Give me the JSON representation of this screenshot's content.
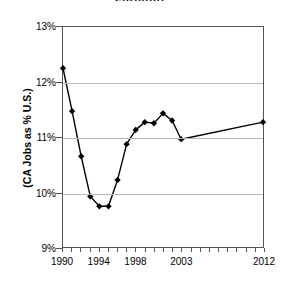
{
  "chart_data": {
    "type": "line",
    "title": "Furniture",
    "xlabel": "",
    "ylabel": "(CA Jobs as % U.S.)",
    "ylim": [
      9,
      13
    ],
    "ytick_labels": [
      "9%",
      "10%",
      "11%",
      "12%",
      "13%"
    ],
    "ytick_values": [
      9,
      10,
      11,
      12,
      13
    ],
    "xtick_labels": [
      "1990",
      "1994",
      "1998",
      "2003",
      "2012"
    ],
    "xtick_values": [
      1990,
      1994,
      1998,
      2003,
      2012
    ],
    "xlim": [
      1990,
      2012
    ],
    "grid": "horizontal",
    "legend": "none",
    "marker": "diamond",
    "line_color": "#000000",
    "grid_color": "#b9b9b9",
    "axis_color": "#555555",
    "categories": [
      1990,
      1991,
      1992,
      1993,
      1994,
      1995,
      1996,
      1997,
      1998,
      1999,
      2000,
      2001,
      2002,
      2003,
      2012
    ],
    "values": [
      12.25,
      11.47,
      10.65,
      9.92,
      9.74,
      9.74,
      10.22,
      10.87,
      11.13,
      11.27,
      11.25,
      11.43,
      11.3,
      10.96,
      11.27
    ],
    "series": [
      {
        "name": "CA Jobs as % U.S.",
        "values": [
          12.25,
          11.47,
          10.65,
          9.92,
          9.74,
          9.74,
          10.22,
          10.87,
          11.13,
          11.27,
          11.25,
          11.43,
          11.3,
          10.96,
          11.27
        ]
      }
    ],
    "x_tick_count": 23
  }
}
